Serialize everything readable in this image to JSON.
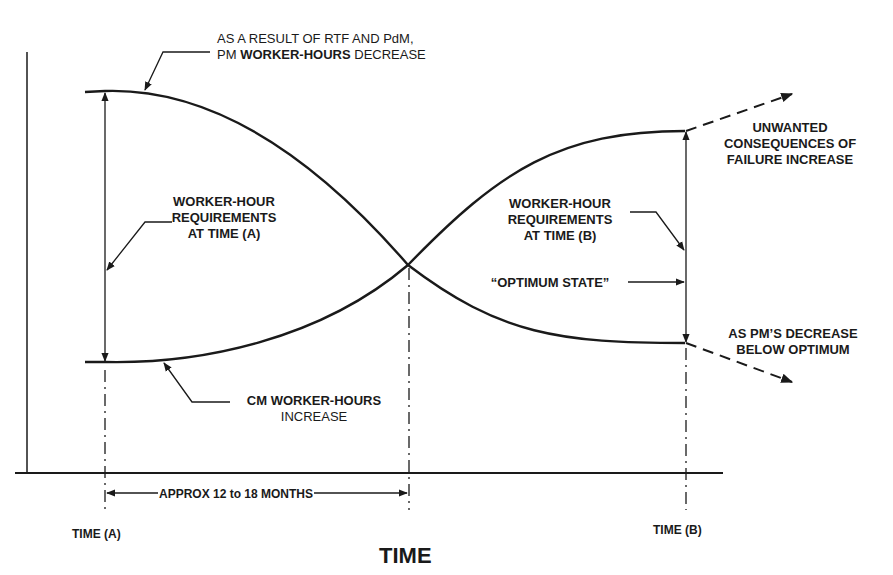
{
  "diagram": {
    "x_axis_title": "TIME",
    "time_a_label": "TIME (A)",
    "time_b_label": "TIME (B)",
    "duration_label": "APPROX 12 to 18 MONTHS",
    "annotations": {
      "pm_decrease": {
        "line1": "AS A RESULT OF RTF AND PdM,",
        "line2_prefix": "PM ",
        "line2_bold": "WORKER-HOURS",
        "line2_suffix": " DECREASE"
      },
      "req_time_a": [
        "WORKER-HOUR",
        "REQUIREMENTS",
        "AT TIME (A)"
      ],
      "req_time_b": [
        "WORKER-HOUR",
        "REQUIREMENTS",
        "AT TIME (B)"
      ],
      "optimum_state": "“OPTIMUM STATE”",
      "unwanted": [
        "UNWANTED",
        "CONSEQUENCES OF",
        "FAILURE INCREASE"
      ],
      "below_optimum": [
        "AS PM’S DECREASE",
        "BELOW OPTIMUM"
      ],
      "cm_increase": [
        "CM WORKER-HOURS",
        "INCREASE"
      ]
    },
    "curves": [
      {
        "name": "PM worker-hours",
        "trend": "decreasing S-curve from high at Time (A) to low at Time (B)"
      },
      {
        "name": "CM worker-hours",
        "trend": "increasing S-curve from low at Time (A) to high at Time (B)"
      }
    ],
    "colors": {
      "ink": "#1a1a1a",
      "background": "#ffffff"
    }
  }
}
